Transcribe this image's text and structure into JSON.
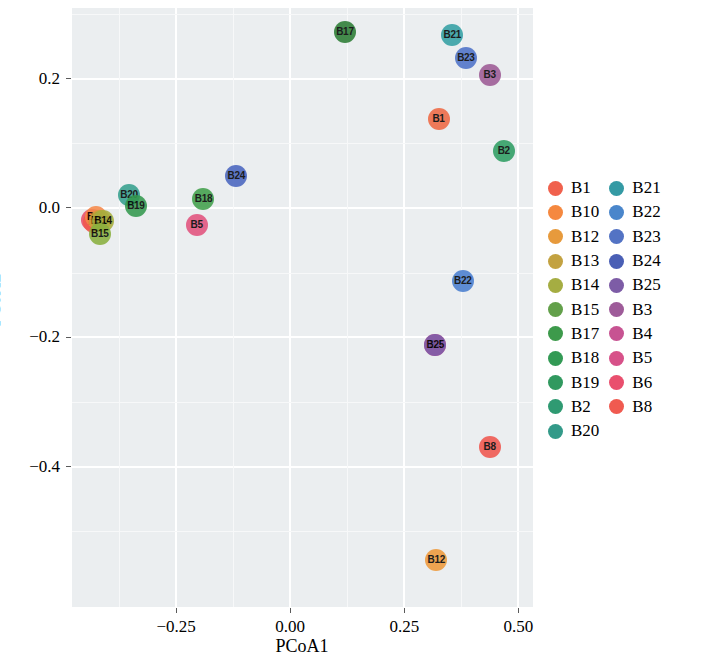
{
  "chart_data": {
    "type": "scatter",
    "title": "",
    "xlabel": "PCoA1",
    "ylabel": "PCoA2",
    "xlim": [
      -0.478,
      0.532
    ],
    "ylim": [
      -0.617,
      0.309
    ],
    "xticks": [
      -0.25,
      0.0,
      0.25,
      0.5
    ],
    "xtick_labels": [
      "−0.25",
      "0.00",
      "0.25",
      "0.50"
    ],
    "yticks": [
      0.2,
      0.0,
      -0.2,
      -0.4
    ],
    "ytick_labels": [
      "0.2",
      "0.0",
      "−0.2",
      "−0.4"
    ],
    "grid": true,
    "legend_position": "right",
    "legend_title": "",
    "panel_background": "#ebeef0",
    "point_label_color": "#000000",
    "points": [
      {
        "label": "B17",
        "x": 0.12,
        "y": 0.272,
        "color": "#2c7d35"
      },
      {
        "label": "B21",
        "x": 0.355,
        "y": 0.268,
        "color": "#34a0a4"
      },
      {
        "label": "B23",
        "x": 0.385,
        "y": 0.232,
        "color": "#4f73c9"
      },
      {
        "label": "B3",
        "x": 0.437,
        "y": 0.205,
        "color": "#9d5b95"
      },
      {
        "label": "B1",
        "x": 0.325,
        "y": 0.137,
        "color": "#ef6a45"
      },
      {
        "label": "B2",
        "x": 0.468,
        "y": 0.088,
        "color": "#2f9e63"
      },
      {
        "label": "B24",
        "x": -0.118,
        "y": 0.05,
        "color": "#4a66c0"
      },
      {
        "label": "B20",
        "x": -0.353,
        "y": 0.02,
        "color": "#35a08e"
      },
      {
        "label": "B18",
        "x": -0.19,
        "y": 0.014,
        "color": "#42a04c"
      },
      {
        "label": "B19",
        "x": -0.338,
        "y": 0.003,
        "color": "#34994f"
      },
      {
        "label": "B5",
        "x": -0.205,
        "y": -0.027,
        "color": "#e2537e"
      },
      {
        "label": "B6",
        "x": -0.434,
        "y": -0.018,
        "color": "#ea4f69"
      },
      {
        "label": "B8",
        "x": -0.43,
        "y": -0.022,
        "color": "#f05a4e"
      },
      {
        "label": "B10",
        "x": -0.426,
        "y": -0.014,
        "color": "#f5894a"
      },
      {
        "label": "B13",
        "x": -0.417,
        "y": -0.02,
        "color": "#c8a039"
      },
      {
        "label": "B14",
        "x": -0.41,
        "y": -0.021,
        "color": "#a8ae3e"
      },
      {
        "label": "B15",
        "x": -0.417,
        "y": -0.04,
        "color": "#8ab03f"
      },
      {
        "label": "B22",
        "x": 0.378,
        "y": -0.113,
        "color": "#4a7fd0"
      },
      {
        "label": "B4",
        "x": 0.318,
        "y": -0.212,
        "color": "#cf5190"
      },
      {
        "label": "B25",
        "x": 0.318,
        "y": -0.212,
        "color": "#7b5ba8"
      },
      {
        "label": "B8b",
        "x": 0.437,
        "y": -0.37,
        "color": "#f0574f"
      },
      {
        "label": "B12",
        "x": 0.32,
        "y": -0.545,
        "color": "#ef9a3c"
      }
    ]
  },
  "legend": {
    "columns": [
      {
        "items": [
          {
            "label": "B1",
            "color": "#f0614d"
          },
          {
            "label": "B10",
            "color": "#f5883f"
          },
          {
            "label": "B12",
            "color": "#e79a3c"
          },
          {
            "label": "B13",
            "color": "#c3a241"
          },
          {
            "label": "B14",
            "color": "#a5ad42"
          },
          {
            "label": "B15",
            "color": "#63a04a"
          },
          {
            "label": "B17",
            "color": "#3d9a4b"
          },
          {
            "label": "B18",
            "color": "#339a55"
          },
          {
            "label": "B19",
            "color": "#31995f"
          },
          {
            "label": "B2",
            "color": "#2f9a72"
          },
          {
            "label": "B20",
            "color": "#339a89"
          }
        ]
      },
      {
        "items": [
          {
            "label": "B21",
            "color": "#349aa4"
          },
          {
            "label": "B22",
            "color": "#4a86cb"
          },
          {
            "label": "B23",
            "color": "#5373c4"
          },
          {
            "label": "B24",
            "color": "#4a5fb5"
          },
          {
            "label": "B25",
            "color": "#7d5ca6"
          },
          {
            "label": "B3",
            "color": "#9e5b99"
          },
          {
            "label": "B4",
            "color": "#c75392"
          },
          {
            "label": "B5",
            "color": "#d75189"
          },
          {
            "label": "B6",
            "color": "#e94f6e"
          },
          {
            "label": "B8",
            "color": "#f05a50"
          }
        ]
      }
    ]
  }
}
